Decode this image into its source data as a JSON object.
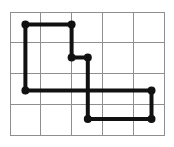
{
  "figure": {
    "title": "Closed polygonal path drawn on a rectangular grid",
    "caption": "",
    "background_color": "#ffffff"
  },
  "grid": {
    "name": "rectangular-lattice",
    "columns": 5,
    "rows": 4,
    "cell_width": 30.8,
    "cell_height": 30.75,
    "origin_x": 10,
    "origin_y": 12,
    "line_color": "#8e8e8e",
    "line_width": 1,
    "border_color": "#8e8e8e",
    "border_width": 1,
    "x_lines": [
      10,
      40.8,
      71.6,
      102.4,
      133.2,
      164
    ],
    "y_lines": [
      12,
      42.75,
      73.5,
      104.25,
      135
    ]
  },
  "path": {
    "name": "polyline-path",
    "closed": true,
    "stroke_color": "#111111",
    "stroke_width": 4,
    "vertex_color": "#111111",
    "vertex_radius": 4,
    "vertex_count": 8,
    "vertices": [
      {
        "label": "v1",
        "x": 25.4,
        "y": 24.5
      },
      {
        "label": "v2",
        "x": 71.6,
        "y": 24.5
      },
      {
        "label": "v3",
        "x": 71.6,
        "y": 57.5
      },
      {
        "label": "v4",
        "x": 87.8,
        "y": 57.5
      },
      {
        "label": "v5",
        "x": 87.8,
        "y": 119.0
      },
      {
        "label": "v6",
        "x": 151.5,
        "y": 119.0
      },
      {
        "label": "v7",
        "x": 151.5,
        "y": 90.5
      },
      {
        "label": "v8",
        "x": 25.4,
        "y": 90.5
      }
    ],
    "segments": [
      {
        "from": "v1",
        "to": "v2",
        "orientation": "horizontal"
      },
      {
        "from": "v2",
        "to": "v3",
        "orientation": "vertical"
      },
      {
        "from": "v3",
        "to": "v4",
        "orientation": "horizontal"
      },
      {
        "from": "v4",
        "to": "v5",
        "orientation": "vertical"
      },
      {
        "from": "v5",
        "to": "v6",
        "orientation": "horizontal"
      },
      {
        "from": "v6",
        "to": "v7",
        "orientation": "vertical"
      },
      {
        "from": "v7",
        "to": "v8",
        "orientation": "horizontal"
      },
      {
        "from": "v8",
        "to": "v1",
        "orientation": "vertical"
      }
    ]
  }
}
